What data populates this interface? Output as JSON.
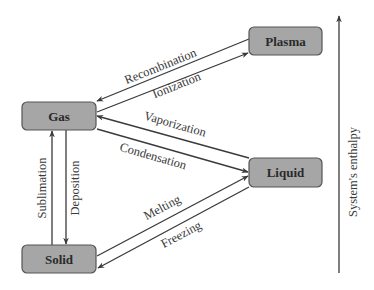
{
  "diagram": {
    "title": "",
    "nodes": {
      "plasma": {
        "label": "Plasma"
      },
      "gas": {
        "label": "Gas"
      },
      "liquid": {
        "label": "Liquid"
      },
      "solid": {
        "label": "Solid"
      }
    },
    "edges": {
      "recombination": {
        "label": "Recombination",
        "from": "Plasma",
        "to": "Gas"
      },
      "ionization": {
        "label": "Ionization",
        "from": "Gas",
        "to": "Plasma"
      },
      "vaporization": {
        "label": "Vaporization",
        "from": "Liquid",
        "to": "Gas"
      },
      "condensation": {
        "label": "Condensation",
        "from": "Gas",
        "to": "Liquid"
      },
      "melting": {
        "label": "Melting",
        "from": "Solid",
        "to": "Liquid"
      },
      "freezing": {
        "label": "Freezing",
        "from": "Liquid",
        "to": "Solid"
      },
      "sublimation": {
        "label": "Sublimation",
        "from": "Solid",
        "to": "Gas"
      },
      "deposition": {
        "label": "Deposition",
        "from": "Gas",
        "to": "Solid"
      }
    },
    "axis": {
      "label": "System's enthalpy",
      "direction": "up"
    },
    "colors": {
      "node_fill": "#a6a6a6",
      "node_stroke": "#555555",
      "line": "#3a3a3a",
      "background": "#ffffff"
    }
  }
}
